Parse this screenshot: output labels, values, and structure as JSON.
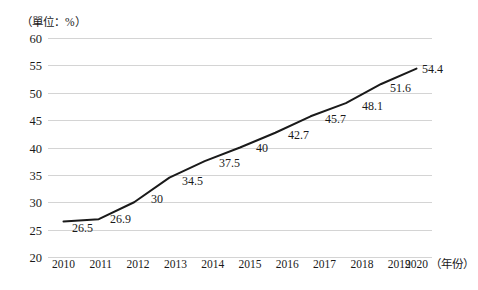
{
  "chart_data": {
    "type": "line",
    "title": "",
    "subtitle": "",
    "xlabel": "（年份）",
    "ylabel": "（單位：%）",
    "unit_note": "（單位：%）",
    "categories": [
      "2010",
      "2011",
      "2012",
      "2013",
      "2014",
      "2015",
      "2016",
      "2017",
      "2018",
      "2019",
      "2020"
    ],
    "values": [
      26.5,
      26.9,
      30,
      34.5,
      37.5,
      40,
      42.7,
      45.7,
      48.1,
      51.6,
      54.4
    ],
    "point_labels": [
      "26.5",
      "26.9",
      "30",
      "34.5",
      "37.5",
      "40",
      "42.7",
      "45.7",
      "48.1",
      "51.6",
      "54.4"
    ],
    "ylim": [
      20,
      60
    ],
    "ytick_values": [
      60,
      55,
      50,
      45,
      40,
      35,
      30,
      25,
      20
    ],
    "ytick_labels": [
      "60",
      "55",
      "50",
      "45",
      "40",
      "35",
      "30",
      "25",
      "20"
    ],
    "ytick_step": 5,
    "grid": true,
    "grid_color": "#d4d4d4",
    "legend": false,
    "legend_position": "none",
    "series": [
      {
        "name": "",
        "values": [
          26.5,
          26.9,
          30,
          34.5,
          37.5,
          40,
          42.7,
          45.7,
          48.1,
          51.6,
          54.4
        ],
        "line_color": "#1a1a1a",
        "line_width": 2,
        "markers": false
      }
    ],
    "colors": {
      "line": "#1a1a1a",
      "grid": "#d4d4d4",
      "text": "#1a1a1a",
      "background": "#ffffff"
    }
  }
}
